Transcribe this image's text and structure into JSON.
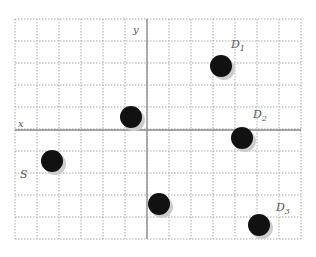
{
  "diagram": {
    "type": "coordinate-grid",
    "grid": {
      "columns": 13,
      "rows": 10,
      "cell_size_px": 22,
      "line_style": "dotted",
      "line_color": "#aaaaaa"
    },
    "axes": {
      "x_label": "x",
      "y_label": "y",
      "axis_color": "#888888"
    },
    "points": [
      {
        "id": "unlabeled-upper",
        "label": "",
        "cx": 131,
        "cy": 117
      },
      {
        "id": "S",
        "label": "S",
        "cx": 52,
        "cy": 161
      },
      {
        "id": "unlabeled-lower",
        "label": "",
        "cx": 159,
        "cy": 204
      },
      {
        "id": "D1",
        "label": "D",
        "sub": "1",
        "cx": 221,
        "cy": 66
      },
      {
        "id": "D2",
        "label": "D",
        "sub": "2",
        "cx": 242,
        "cy": 138
      },
      {
        "id": "D3",
        "label": "D",
        "sub": "3",
        "cx": 259,
        "cy": 225
      }
    ],
    "labels": {
      "S": "S",
      "D1": "D",
      "D1_sub": "1",
      "D2": "D",
      "D2_sub": "2",
      "D3": "D",
      "D3_sub": "3"
    },
    "dot_color": "#111111",
    "shadow_color": "#cccccc"
  }
}
